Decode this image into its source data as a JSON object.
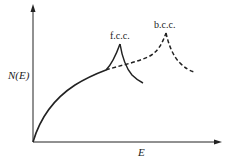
{
  "diagram": {
    "type": "density-of-states sketch",
    "y_axis_label": "N(E)",
    "x_axis_label": "E",
    "curves": [
      {
        "name": "free-electron / f.c.c.",
        "style": "solid",
        "peak_label": "f.c.c."
      },
      {
        "name": "b.c.c.",
        "style": "dashed",
        "peak_label": "b.c.c."
      }
    ],
    "labels": {
      "fcc": "f.c.c.",
      "bcc": "b.c.c.",
      "ylabel": "N(E)",
      "xlabel": "E"
    },
    "colors": {
      "line": "#222222",
      "background": "#ffffff"
    }
  }
}
